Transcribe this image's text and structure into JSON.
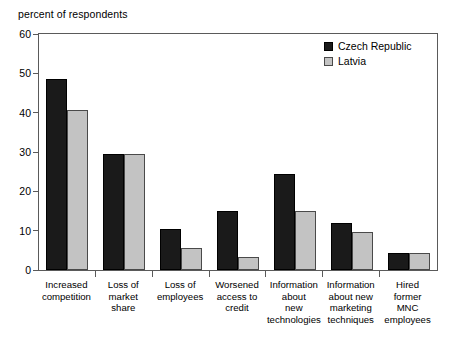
{
  "chart_data": {
    "type": "bar",
    "title": "",
    "ylabel": "percent of respondents",
    "xlabel": "",
    "ylim": [
      0,
      60
    ],
    "yticks": [
      0,
      10,
      20,
      30,
      40,
      50,
      60
    ],
    "grid": false,
    "legend_position": "top-right",
    "categories": [
      "Increased\ncompetition",
      "Loss of\nmarket\nshare",
      "Loss of\nemployees",
      "Worsened\naccess to\ncredit",
      "Information\nabout\nnew\ntechnologies",
      "Information\nabout new\nmarketing\ntechniques",
      "Hired\nformer\nMNC\nemployees"
    ],
    "series": [
      {
        "name": "Czech Republic",
        "color": "#1a1a1a",
        "values": [
          48.5,
          29.4,
          10.4,
          15.0,
          24.4,
          12.0,
          4.2
        ]
      },
      {
        "name": "Latvia",
        "color": "#c3c3c3",
        "values": [
          40.7,
          29.5,
          5.7,
          3.3,
          15.0,
          9.6,
          4.2
        ]
      }
    ]
  },
  "axis": {
    "y_title": "percent of respondents",
    "tick_labels": [
      "0",
      "10",
      "20",
      "30",
      "40",
      "50",
      "60"
    ]
  },
  "legend": {
    "items": [
      {
        "label": "Czech Republic",
        "swatch": "black-square-icon"
      },
      {
        "label": "Latvia",
        "swatch": "gray-square-icon"
      }
    ]
  }
}
